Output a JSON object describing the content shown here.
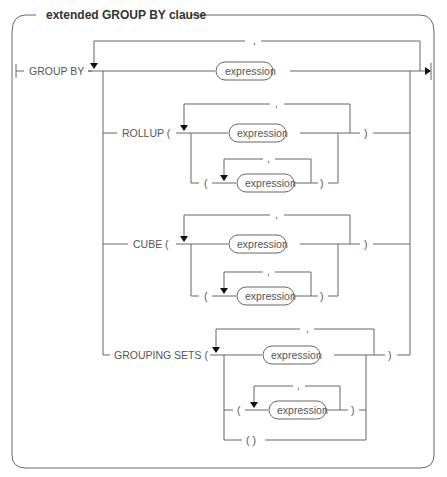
{
  "diagram": {
    "title": "extended GROUP BY clause",
    "start_keyword": "GROUP BY",
    "separator": ",",
    "top_expression": "expression",
    "branches": [
      {
        "keyword": "ROLLUP (",
        "expression": "expression",
        "nested_open": "(",
        "nested_expression": "expression",
        "nested_close": ")",
        "close": ")"
      },
      {
        "keyword": "CUBE (",
        "expression": "expression",
        "nested_open": "(",
        "nested_expression": "expression",
        "nested_close": ")",
        "close": ")"
      },
      {
        "keyword": "GROUPING SETS (",
        "expression": "expression",
        "nested_open": "(",
        "nested_expression": "expression",
        "nested_close": ")",
        "empty_set": "( )",
        "close": ")"
      }
    ]
  }
}
